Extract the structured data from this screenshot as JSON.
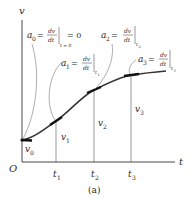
{
  "axes": {
    "y_label": "v",
    "x_label": "t",
    "origin_label": "O"
  },
  "ticks": [
    {
      "label": "t",
      "sub": "1"
    },
    {
      "label": "t",
      "sub": "2"
    },
    {
      "label": "t",
      "sub": "3"
    }
  ],
  "velocities": [
    {
      "label": "v",
      "sub": "0"
    },
    {
      "label": "v",
      "sub": "1"
    },
    {
      "label": "v",
      "sub": "2"
    },
    {
      "label": "v",
      "sub": "3"
    }
  ],
  "annotations": [
    {
      "lhs": "a",
      "sub": "0",
      "num": "dv",
      "den": "dt",
      "eval": "t = 0",
      "rhs": "= 0"
    },
    {
      "lhs": "a",
      "sub": "1",
      "num": "dv",
      "den": "dt",
      "eval": "t",
      "eval_sub": "1"
    },
    {
      "lhs": "a",
      "sub": "2",
      "num": "dv",
      "den": "dt",
      "eval": "t",
      "eval_sub": "2"
    },
    {
      "lhs": "a",
      "sub": "3",
      "num": "dv",
      "den": "dt",
      "eval": "t",
      "eval_sub": "3"
    }
  ],
  "caption": "(a)",
  "colors": {
    "ink": "#2a2a2a",
    "curve": "#333333",
    "tangent": "#111111",
    "leader": "#777777"
  }
}
